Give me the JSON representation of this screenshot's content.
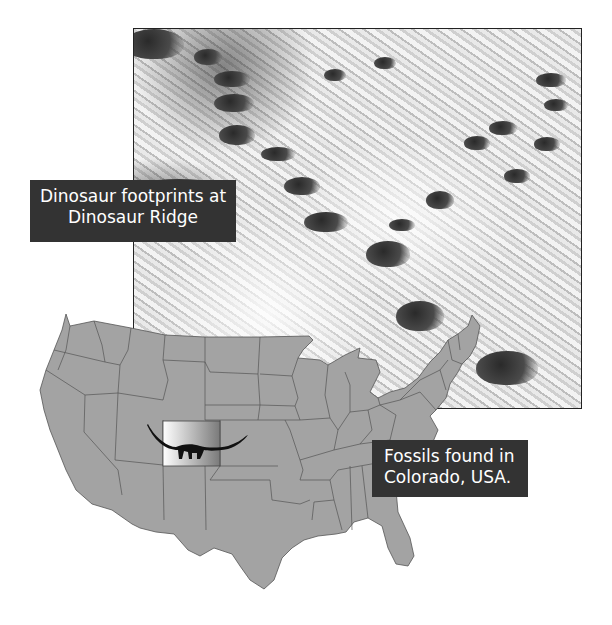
{
  "photo": {
    "subject": "dinosaur-footprints-rock-surface",
    "caption_line1": "Dinosaur footprints at",
    "caption_line2": "Dinosaur Ridge"
  },
  "map": {
    "region": "Contiguous United States",
    "highlighted_state": "Colorado",
    "highlight_icon": "sauropod-dinosaur-silhouette",
    "caption_line1": "Fossils found in",
    "caption_line2": "Colorado, USA."
  },
  "colors": {
    "label_background": "#333333",
    "label_text": "#ffffff",
    "map_fill": "#a3a3a3",
    "map_border": "#555555",
    "highlight_start": "#ffffff",
    "highlight_end": "#7a7a7a",
    "dinosaur": "#111111"
  }
}
